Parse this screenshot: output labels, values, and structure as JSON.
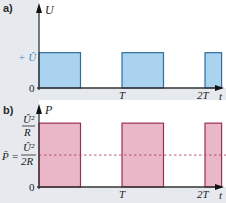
{
  "chart_data": [
    {
      "panel_label": "a)",
      "type": "line",
      "title": "",
      "ylabel": "U",
      "xlabel": "t",
      "x_ticks": [
        "T",
        "2T"
      ],
      "x_tick_values": [
        1,
        2
      ],
      "y_ticks": [
        "0",
        "+ Û"
      ],
      "y_tick_values": [
        0,
        1
      ],
      "xlim": [
        0,
        2.2
      ],
      "ylim": [
        0,
        2.35
      ],
      "pulses": [
        {
          "start": 0,
          "end": 0.5,
          "value": 1
        },
        {
          "start": 1,
          "end": 1.5,
          "value": 1
        },
        {
          "start": 2,
          "end": 2.2,
          "value": 1
        }
      ],
      "fill_color": "#a9d3ef",
      "stroke_color": "#2f6f9f",
      "tick_label_color": "#4a86c0"
    },
    {
      "panel_label": "b)",
      "type": "line",
      "title": "",
      "ylabel": "P",
      "xlabel": "t",
      "x_ticks": [
        "T",
        "2T"
      ],
      "x_tick_values": [
        1,
        2
      ],
      "y_ticks": [
        "0",
        "Û²/R"
      ],
      "y_tick_values": [
        0,
        1
      ],
      "y_tick_top": {
        "numerator": "Û²",
        "denominator": "R"
      },
      "mean_label": {
        "prefix": "P̄ =",
        "numerator": "Û²",
        "denominator": "2R"
      },
      "mean_value": 0.5,
      "xlim": [
        0,
        2.2
      ],
      "ylim": [
        0,
        1.3
      ],
      "pulses": [
        {
          "start": 0,
          "end": 0.5,
          "value": 1
        },
        {
          "start": 1,
          "end": 1.5,
          "value": 1
        },
        {
          "start": 2,
          "end": 2.2,
          "value": 1
        }
      ],
      "fill_color": "#e9b7c8",
      "stroke_color": "#9b3050",
      "mean_line_color": "#b04a6a"
    }
  ]
}
